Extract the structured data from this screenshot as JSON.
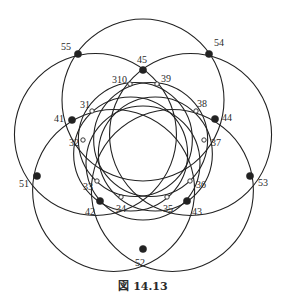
{
  "figure": {
    "caption": "図 14.13",
    "center": [
      143,
      150
    ],
    "large_circles": {
      "count": 5,
      "center_distance": 50,
      "radius": 81,
      "start_angle_deg": -90,
      "stroke": "#222222"
    },
    "small_circles": {
      "count": 5,
      "center_distance": 13,
      "radius": 57,
      "start_angle_deg": -126,
      "stroke": "#222222"
    },
    "big_points": [
      {
        "label": "45",
        "x": 143,
        "y": 70,
        "lx": 137,
        "ly": 63
      },
      {
        "label": "55",
        "x": 78,
        "y": 54,
        "lx": 61,
        "ly": 50
      },
      {
        "label": "54",
        "x": 209,
        "y": 54,
        "lx": 214,
        "ly": 46
      },
      {
        "label": "41",
        "x": 72,
        "y": 120,
        "lx": 54,
        "ly": 122
      },
      {
        "label": "44",
        "x": 215,
        "y": 119,
        "lx": 222,
        "ly": 121
      },
      {
        "label": "51",
        "x": 37,
        "y": 176,
        "lx": 19,
        "ly": 187
      },
      {
        "label": "53",
        "x": 250,
        "y": 176,
        "lx": 258,
        "ly": 186
      },
      {
        "label": "42",
        "x": 100,
        "y": 201,
        "lx": 85,
        "ly": 215
      },
      {
        "label": "43",
        "x": 187,
        "y": 201,
        "lx": 192,
        "ly": 215
      },
      {
        "label": "52",
        "x": 143,
        "y": 249,
        "lx": 135,
        "ly": 266
      }
    ],
    "small_points": [
      {
        "label": "310",
        "x": 130,
        "y": 84,
        "lx": 112,
        "ly": 83
      },
      {
        "label": "39",
        "x": 157,
        "y": 84,
        "lx": 161,
        "ly": 82
      },
      {
        "label": "31",
        "x": 92,
        "y": 111,
        "lx": 80,
        "ly": 108
      },
      {
        "label": "38",
        "x": 196,
        "y": 111,
        "lx": 197,
        "ly": 107
      },
      {
        "label": "32",
        "x": 83,
        "y": 140,
        "lx": 69,
        "ly": 146
      },
      {
        "label": "37",
        "x": 204,
        "y": 140,
        "lx": 211,
        "ly": 146
      },
      {
        "label": "33",
        "x": 97,
        "y": 181,
        "lx": 83,
        "ly": 190
      },
      {
        "label": "36",
        "x": 190,
        "y": 181,
        "lx": 196,
        "ly": 188
      },
      {
        "label": "34",
        "x": 121,
        "y": 197,
        "lx": 116,
        "ly": 212
      },
      {
        "label": "35",
        "x": 167,
        "y": 197,
        "lx": 163,
        "ly": 212
      }
    ],
    "colors": {
      "ink": "#222222",
      "background": "#ffffff"
    }
  }
}
